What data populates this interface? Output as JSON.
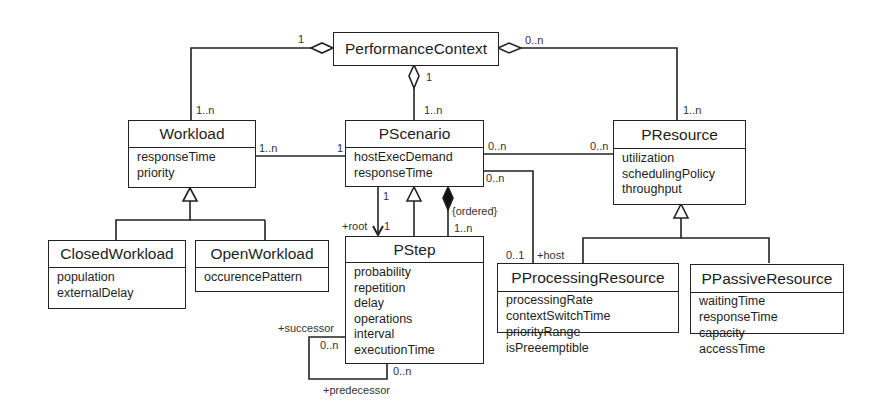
{
  "diagram": {
    "type": "UML class diagram",
    "classes": {
      "performance_context": {
        "name": "PerformanceContext",
        "attributes": []
      },
      "workload": {
        "name": "Workload",
        "attributes": [
          "responseTime",
          "priority"
        ]
      },
      "pscenario": {
        "name": "PScenario",
        "attributes": [
          "hostExecDemand",
          "responseTime"
        ]
      },
      "presource": {
        "name": "PResource",
        "attributes": [
          "utilization",
          "schedulingPolicy",
          "throughput"
        ]
      },
      "closed_workload": {
        "name": "ClosedWorkload",
        "attributes": [
          "population",
          "externalDelay"
        ]
      },
      "open_workload": {
        "name": "OpenWorkload",
        "attributes": [
          "occurencePattern"
        ]
      },
      "pstep": {
        "name": "PStep",
        "attributes": [
          "probability",
          "repetition",
          "delay",
          "operations",
          "interval",
          "executionTime"
        ]
      },
      "pprocessing_resource": {
        "name": "PProcessingResource",
        "attributes": [
          "processingRate",
          "contextSwitchTime",
          "priorityRange",
          "isPreeemptible"
        ]
      },
      "ppassive_resource": {
        "name": "PPassiveResource",
        "attributes": [
          "waitingTime",
          "responseTime",
          "capacity",
          "accessTime"
        ]
      }
    },
    "labels": {
      "pc_workload_pc_end": "1",
      "pc_workload_wl_end": "1..n",
      "pc_scenario_pc_end": "1",
      "pc_scenario_sc_end": "1..n",
      "pc_resource_pc_end": "0..n",
      "pc_resource_res_end": "1..n",
      "wl_scenario_wl_end": "1..n",
      "wl_scenario_sc_end": "1",
      "sc_resource_sc_end": "0..n",
      "sc_resource_res_end": "0..n",
      "sc_host_sc_end": "0..n",
      "sc_host_res_end": "0..1",
      "host_role": "+host",
      "root_sc_end": "1",
      "root_step_end": "1",
      "root_role": "+root",
      "ordered_constraint": "{ordered}",
      "steps_mult": "1..n",
      "successor_role": "+successor",
      "successor_mult": "0..n",
      "predecessor_role": "+predecessor",
      "predecessor_mult": "0..n"
    }
  }
}
